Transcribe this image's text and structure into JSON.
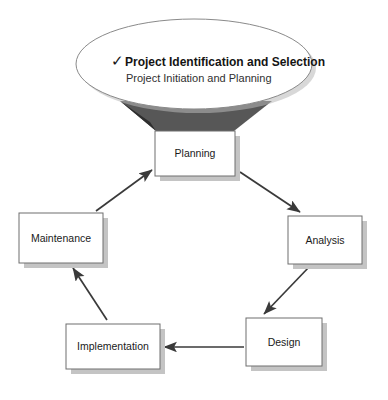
{
  "diagram": {
    "type": "cycle-diagram",
    "background_color": "#ffffff",
    "node_fill": "#ffffff",
    "node_stroke": "#6e6e6e",
    "node_shadow": "#c4c4c4",
    "arrow_color": "#3a3a3a",
    "callout_tail_color": "#4a4a4a",
    "nodes": [
      {
        "id": "planning",
        "label": "Planning",
        "x": 155,
        "y": 131,
        "w": 80,
        "h": 45
      },
      {
        "id": "analysis",
        "label": "Analysis",
        "x": 288,
        "y": 216,
        "w": 74,
        "h": 48
      },
      {
        "id": "design",
        "label": "Design",
        "x": 246,
        "y": 318,
        "w": 76,
        "h": 48
      },
      {
        "id": "implementation",
        "label": "Implementation",
        "x": 66,
        "y": 324,
        "w": 94,
        "h": 45
      },
      {
        "id": "maintenance",
        "label": "Maintenance",
        "x": 19,
        "y": 213,
        "w": 84,
        "h": 50
      }
    ],
    "arrows": [
      {
        "id": "planning-to-analysis",
        "from": "planning",
        "to": "analysis",
        "x1": 240,
        "y1": 172,
        "x2": 300,
        "y2": 212
      },
      {
        "id": "analysis-to-design",
        "from": "analysis",
        "to": "design",
        "x1": 310,
        "y1": 266,
        "x2": 264,
        "y2": 314
      },
      {
        "id": "design-to-implementation",
        "from": "design",
        "to": "implementation",
        "x1": 244,
        "y1": 347,
        "x2": 164,
        "y2": 347
      },
      {
        "id": "implementation-to-maintenance",
        "from": "implementation",
        "to": "maintenance",
        "x1": 107,
        "y1": 320,
        "x2": 73,
        "y2": 268
      },
      {
        "id": "maintenance-to-planning",
        "from": "maintenance",
        "to": "planning",
        "x1": 96,
        "y1": 211,
        "x2": 152,
        "y2": 170
      }
    ],
    "callout": {
      "id": "planning-callout",
      "shape": "oval",
      "cx": 194,
      "cy": 64,
      "rx": 118,
      "ry": 45,
      "target": "planning",
      "check_mark": "✓",
      "title": "Project Identification and Selection",
      "subtitle": "Project Initiation and Planning"
    }
  }
}
